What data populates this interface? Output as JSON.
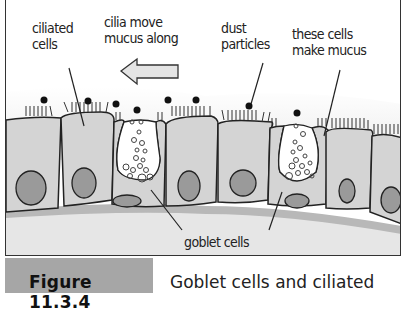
{
  "figure": {
    "labels": {
      "ciliated_cells": [
        "ciliated",
        "cells"
      ],
      "cilia_move": [
        "cilia move",
        "mucus along"
      ],
      "dust": [
        "dust",
        "particles"
      ],
      "these_cells": [
        "these cells",
        "make mucus"
      ],
      "goblet_cells": "goblet cells"
    },
    "caption": {
      "number": "Figure 11.3.4",
      "text": "Goblet cells and ciliated"
    },
    "arrow": {
      "direction": "left",
      "meaning": "cilia move mucus along"
    }
  },
  "colors": {
    "cell_fill": "#d4d4d4",
    "nucleus_fill": "#9a9a9a",
    "outline": "#222222",
    "mucus_layer": "#f0f0f0",
    "basement": "#b8b8b8",
    "caption_bar": "#a6a6a6",
    "arrow_fill": "#e4e4e4"
  }
}
